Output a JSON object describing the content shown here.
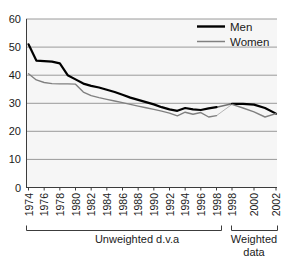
{
  "chart_data": {
    "type": "line",
    "title": "",
    "xlabel": "",
    "ylabel": "",
    "ylim": [
      0,
      60
    ],
    "yticks": [
      0,
      10,
      20,
      30,
      40,
      50,
      60
    ],
    "grid": true,
    "legend_position": "top-right",
    "x": [
      "1974",
      "1975",
      "1976",
      "1977",
      "1978",
      "1979",
      "1980",
      "1981",
      "1982",
      "1983",
      "1984",
      "1985",
      "1986",
      "1987",
      "1988",
      "1989",
      "1990",
      "1991",
      "1992",
      "1993",
      "1994",
      "1995",
      "1996",
      "1997",
      "1998",
      "1998w",
      "1999",
      "2000",
      "2001",
      "2002"
    ],
    "xtick_labels_unweighted": [
      "1974",
      "1976",
      "1978",
      "1980",
      "1982",
      "1984",
      "1986",
      "1988",
      "1990",
      "1992",
      "1994",
      "1996",
      "1998"
    ],
    "xtick_labels_weighted": [
      "1998",
      "2000",
      "2002"
    ],
    "series": [
      {
        "name": "Men",
        "color": "#000000",
        "width": 2.2,
        "values_unweighted": [
          51.0,
          45.2,
          45.0,
          44.8,
          44.2,
          40.0,
          38.5,
          37.0,
          36.2,
          35.6,
          34.8,
          34.0,
          33.0,
          32.0,
          31.2,
          30.4,
          29.6,
          28.6,
          27.8,
          27.3,
          28.3,
          27.8,
          27.6,
          28.2,
          28.6
        ],
        "values_weighted": [
          29.8,
          29.8,
          29.5,
          28.3,
          26.3
        ]
      },
      {
        "name": "Women",
        "color": "#808080",
        "width": 1.4,
        "values_unweighted": [
          40.5,
          38.3,
          37.4,
          37.0,
          36.9,
          36.9,
          36.8,
          34.0,
          32.7,
          32.0,
          31.4,
          30.8,
          30.2,
          29.6,
          29.0,
          28.4,
          27.8,
          27.2,
          26.5,
          25.5,
          26.8,
          26.1,
          26.7,
          25.1,
          25.6
        ],
        "values_weighted": [
          29.6,
          28.3,
          26.9,
          25.1,
          26.3
        ]
      }
    ],
    "annotations": [
      {
        "name": "unweighted-group",
        "text": "Unweighted d.v.a"
      },
      {
        "name": "weighted-group",
        "text": "Weighted\ndata"
      }
    ]
  },
  "axis": {
    "y_labels": [
      "60",
      "50",
      "40",
      "30",
      "20",
      "10",
      "0"
    ]
  },
  "legend": {
    "entries": [
      {
        "label": "Men"
      },
      {
        "label": "Women"
      }
    ]
  },
  "groups": {
    "unweighted": {
      "label": "Unweighted d.v.a",
      "years": [
        "1974",
        "1976",
        "1978",
        "1980",
        "1982",
        "1984",
        "1986",
        "1988",
        "1990",
        "1992",
        "1994",
        "1996",
        "1998"
      ]
    },
    "weighted": {
      "label_line1": "Weighted",
      "label_line2": "data",
      "years": [
        "1998",
        "2000",
        "2002"
      ]
    }
  },
  "colors": {
    "men_line": "#000000",
    "women_line": "#808080",
    "gridline": "#9a9a9a",
    "plot_background": "#f6f6f6",
    "axis": "#3c3c3c",
    "text": "#1a1a1a"
  }
}
